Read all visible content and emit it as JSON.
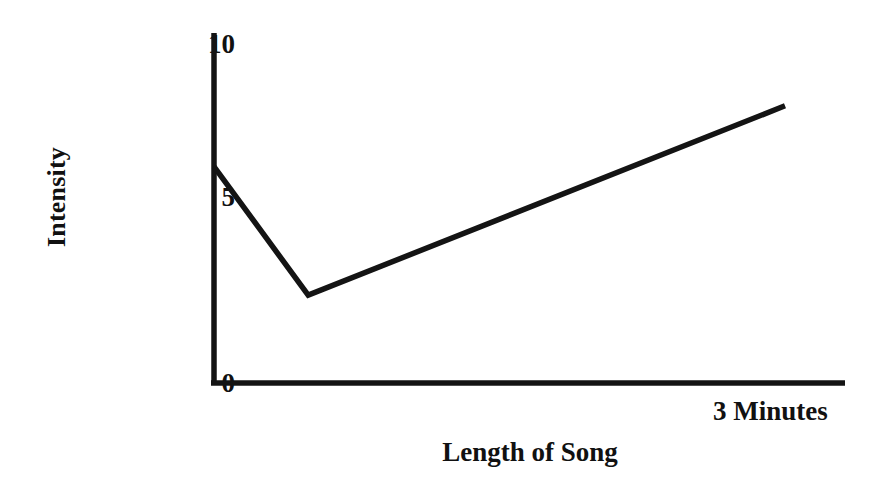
{
  "chart_data": {
    "type": "line",
    "title": "",
    "xlabel": "Length of Song",
    "ylabel": "Intensity",
    "ytick_labels": [
      "10",
      "5",
      "0"
    ],
    "ytick_values": [
      10,
      5,
      0
    ],
    "ylim": [
      0,
      10.2
    ],
    "xlim": [
      0,
      3.3
    ],
    "x_axis_end_annotation": "3 Minutes",
    "xtick_labels": [],
    "grid": false,
    "legend": false,
    "axis_style": "left-and-bottom-spine-only",
    "series": [
      {
        "name": "Intensity over song length",
        "x": [
          0.0,
          0.47,
          2.85
        ],
        "y": [
          6.4,
          2.6,
          8.2
        ],
        "point_labels": [
          "start",
          "minimum",
          "end"
        ],
        "line_color": "#141414",
        "line_width_px": 5.5
      }
    ],
    "colors": {
      "background": "#ffffff",
      "axis": "#141414",
      "text": "#111111",
      "line": "#141414"
    }
  },
  "axis_labels": {
    "y_title": "Intensity",
    "x_title": "Length of Song",
    "x_end": "3 Minutes",
    "tick_10": "10",
    "tick_5": "5",
    "tick_0": "0"
  }
}
